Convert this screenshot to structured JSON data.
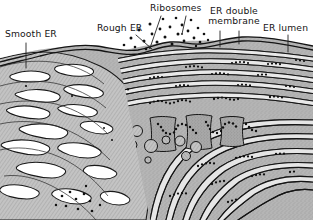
{
  "figure": {
    "background_color": "#ffffff",
    "ink_color": "#151515",
    "membrane_color": "#1a1a1a",
    "cytoplasm_color": "#b9b9b9",
    "lumen_color": "#e8e8e8",
    "tubule_fill": "#c2c2c2",
    "ribosome_color": "#111111"
  },
  "labels": {
    "smooth_er": "Smooth ER",
    "rough_er": "Rough ER",
    "ribosomes": "Ribosomes",
    "er_double_membrane": "ER double membrane",
    "er_lumen": "ER lumen"
  },
  "structures": {
    "smooth_er_region": "tubular network of interconnected smooth ER tubules, left side",
    "rough_er_region": "stacked flattened cisternae with ribosome chains, right side",
    "free_ribosomes": "cluster of dark dots in cytosol above cisternae",
    "polysomes": "chains of ribosomes forming squiggly strings on cisternal membranes",
    "vesicles": "rounded vesicles and transitional elements in lower middle"
  },
  "leader_lines": {
    "smooth_er": 1,
    "rough_er": 1,
    "ribosomes": 2,
    "er_double_membrane": 2,
    "er_lumen": 1
  }
}
